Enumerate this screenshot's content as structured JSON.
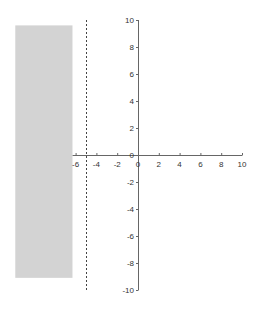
{
  "chart_data": {
    "type": "area",
    "title": "",
    "xlabel": "",
    "ylabel": "",
    "xlim": [
      -6,
      10
    ],
    "ylim": [
      -10,
      10
    ],
    "grid": false,
    "x_ticks": [
      -6,
      -4,
      -2,
      0,
      2,
      4,
      6,
      8,
      10
    ],
    "y_ticks": [
      -10,
      -8,
      -6,
      -4,
      -2,
      0,
      2,
      4,
      6,
      8,
      10
    ],
    "x_tick_labels": [
      "-6",
      "-4",
      "-2",
      "0",
      "2",
      "4",
      "6",
      "8",
      "10"
    ],
    "y_tick_labels": [
      "-10",
      "-8",
      "-6",
      "-4",
      "-2",
      "0",
      "2",
      "4",
      "6",
      "8",
      "10"
    ],
    "dashed_line": {
      "orientation": "vertical",
      "x": -5,
      "y_range": [
        -10,
        10
      ],
      "style": "dashed",
      "color": "#333333"
    },
    "shaded_region": {
      "x_range": [
        -11.8,
        -6.3
      ],
      "y_range": [
        -9.1,
        9.6
      ],
      "color": "#d3d3d3"
    }
  },
  "colors": {
    "axis": "#555555",
    "shade": "#d3d3d3",
    "dashed": "#444444",
    "label": "#333333"
  }
}
